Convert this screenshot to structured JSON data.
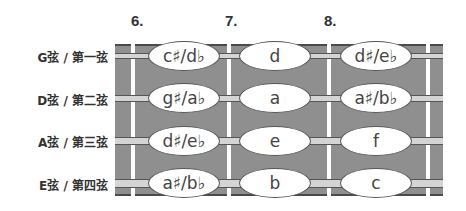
{
  "fret_numbers": [
    "6.",
    "7.",
    "8."
  ],
  "strings": [
    {
      "label": "G弦 / 第一弦",
      "notes": [
        "c♯/d♭",
        "d",
        "d♯/e♭"
      ]
    },
    {
      "label": "D弦 / 第二弦",
      "notes": [
        "g♯/a♭",
        "a",
        "a♯/b♭"
      ]
    },
    {
      "label": "A弦 / 第三弦",
      "notes": [
        "d♯/e♭",
        "e",
        "f"
      ]
    },
    {
      "label": "E弦 / 第四弦",
      "notes": [
        "a♯/b♭",
        "b",
        "c"
      ]
    }
  ],
  "colors": {
    "board": "#8f8f8f",
    "fret": "#ffffff",
    "string": "#d4d4d4",
    "outline": "#4a4a4a"
  }
}
